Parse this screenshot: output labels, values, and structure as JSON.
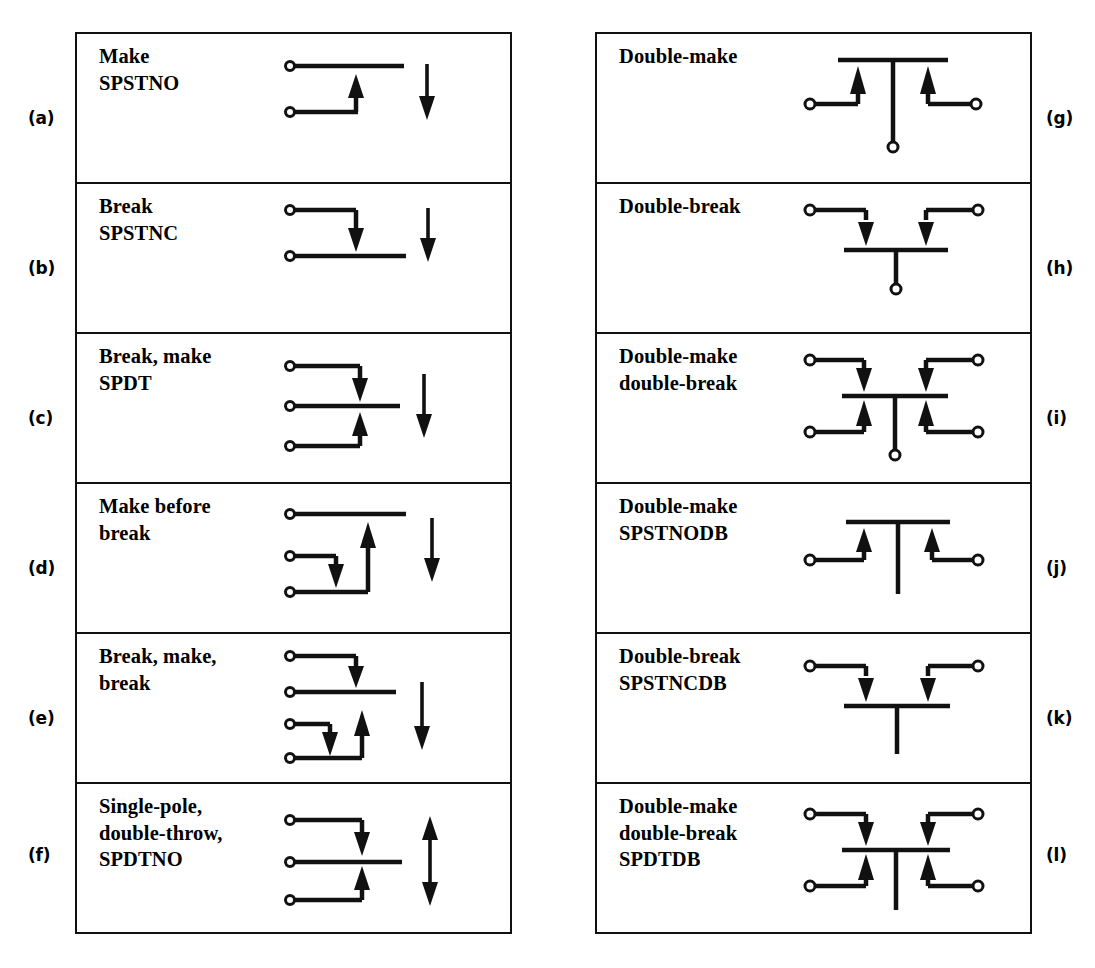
{
  "figure": {
    "type": "switch-contact-forms-chart",
    "stroke_color": "#111111",
    "background_color": "#ffffff"
  },
  "left_column": {
    "cells": [
      {
        "index_label": "(a)",
        "lines": [
          "Make",
          "SPSTNO"
        ],
        "symbol": "spst-no",
        "actuator": "single-down-arrow"
      },
      {
        "index_label": "(b)",
        "lines": [
          "Break",
          "SPSTNC"
        ],
        "symbol": "spst-nc",
        "actuator": "single-down-arrow"
      },
      {
        "index_label": "(c)",
        "lines": [
          "Break, make",
          "SPDT"
        ],
        "symbol": "spdt-break-make",
        "actuator": "single-down-arrow"
      },
      {
        "index_label": "(d)",
        "lines": [
          "Make before",
          "break"
        ],
        "symbol": "make-before-break",
        "actuator": "single-down-arrow"
      },
      {
        "index_label": "(e)",
        "lines": [
          "Break, make,",
          "break"
        ],
        "symbol": "break-make-break",
        "actuator": "single-down-arrow"
      },
      {
        "index_label": "(f)",
        "lines": [
          "Single-pole,",
          "double-throw,",
          "SPDTNO"
        ],
        "symbol": "spdtno",
        "actuator": "double-headed-arrow"
      }
    ]
  },
  "right_column": {
    "cells": [
      {
        "index_label": "(g)",
        "lines": [
          "Double-make"
        ],
        "symbol": "double-make",
        "actuator": "none"
      },
      {
        "index_label": "(h)",
        "lines": [
          "Double-break"
        ],
        "symbol": "double-break",
        "actuator": "none"
      },
      {
        "index_label": "(i)",
        "lines": [
          "Double-make",
          "double-break"
        ],
        "symbol": "double-make-double-break",
        "actuator": "none"
      },
      {
        "index_label": "(j)",
        "lines": [
          "Double-make",
          "SPSTNODB"
        ],
        "symbol": "spstnodb",
        "actuator": "none"
      },
      {
        "index_label": "(k)",
        "lines": [
          "Double-break",
          "SPSTNCDB"
        ],
        "symbol": "spstncdb",
        "actuator": "none"
      },
      {
        "index_label": "(l)",
        "lines": [
          "Double-make",
          "double-break",
          "SPDTDB"
        ],
        "symbol": "spdtdb",
        "actuator": "none"
      }
    ]
  }
}
